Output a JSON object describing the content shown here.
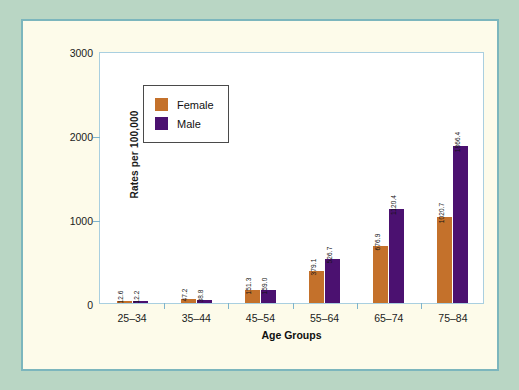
{
  "chart_data": {
    "type": "bar",
    "title": "",
    "xlabel": "Age Groups",
    "ylabel": "Rates per 100,000",
    "categories": [
      "25–34",
      "35–44",
      "45–54",
      "55–64",
      "65–74",
      "75–84"
    ],
    "series": [
      {
        "name": "Female",
        "color": "#c4712b",
        "values": [
          12.6,
          47.2,
          151.3,
          379.1,
          676.9,
          1020.7
        ],
        "labels": [
          "12.6",
          "47.2",
          "151.3",
          "379.1",
          "676.9",
          "1020.7"
        ]
      },
      {
        "name": "Male",
        "color": "#4b1170",
        "values": [
          12.2,
          38.8,
          159.0,
          526.7,
          1120.4,
          1866.4
        ],
        "labels": [
          "12.2",
          "38.8",
          "159.0",
          "526.7",
          "1120.4",
          "1866.4"
        ]
      }
    ],
    "ylim": [
      0,
      3000
    ],
    "yticks": [
      0,
      1000,
      2000,
      3000
    ],
    "ytick_labels": [
      "0",
      "1000",
      "2000",
      "3000"
    ],
    "grid": false,
    "legend_position": "upper-left"
  },
  "legend": {
    "entries": [
      {
        "label": "Female",
        "color": "#c4712b"
      },
      {
        "label": "Male",
        "color": "#4b1170"
      }
    ]
  },
  "axes": {
    "y_title": "Rates per 100,000",
    "x_title": "Age Groups"
  },
  "colors": {
    "page_background": "#b9d6c4",
    "card_background": "#fdfbea",
    "card_border": "#7cb6bd",
    "plot_background": "#ffffff",
    "plot_border": "#a9cfe0",
    "female": "#c4712b",
    "male": "#4b1170"
  }
}
